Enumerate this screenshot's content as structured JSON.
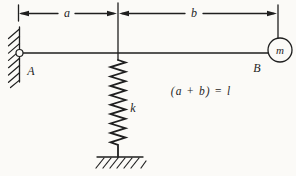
{
  "figure": {
    "background_color": "#fbfaf7",
    "line_color": "#1f1f1f",
    "labels": {
      "dim_a": "a",
      "dim_b": "b",
      "support_point": "A",
      "mass_point": "B",
      "mass": "m",
      "spring_constant": "k"
    },
    "equation": "(a + b) = l"
  }
}
